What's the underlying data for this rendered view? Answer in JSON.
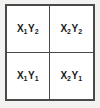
{
  "diagram": {
    "type": "2x2-grid",
    "rows": 2,
    "columns": 2,
    "colors": {
      "page_background": "#f2f2f0",
      "cell_background": "#ffffff",
      "border": "#4a4a4a",
      "text": "#1a1a1a"
    },
    "cells": [
      {
        "position": "top-left",
        "label": "X1Y2",
        "x_variable": "X",
        "x_subscript": "1",
        "y_variable": "Y",
        "y_subscript": "2"
      },
      {
        "position": "top-right",
        "label": "X2Y2",
        "x_variable": "X",
        "x_subscript": "2",
        "y_variable": "Y",
        "y_subscript": "2"
      },
      {
        "position": "bottom-left",
        "label": "X1Y1",
        "x_variable": "X",
        "x_subscript": "1",
        "y_variable": "Y",
        "y_subscript": "1"
      },
      {
        "position": "bottom-right",
        "label": "X2Y1",
        "x_variable": "X",
        "x_subscript": "2",
        "y_variable": "Y",
        "y_subscript": "1"
      }
    ]
  }
}
